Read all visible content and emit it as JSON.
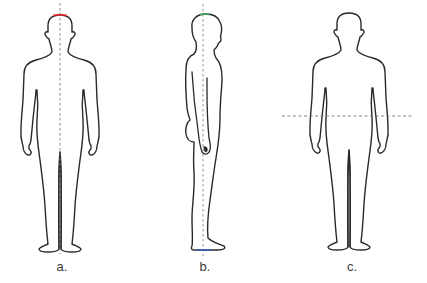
{
  "diagram": {
    "figures": [
      {
        "id": "a",
        "label": "a.",
        "view": "anterior",
        "reference_line": "vertical midline (sagittal plane)",
        "highlight": "red mark on top of head"
      },
      {
        "id": "b",
        "label": "b.",
        "view": "lateral",
        "reference_line": "vertical line (frontal/coronal plane)",
        "highlight": "green mark on head top, blue mark at feet"
      },
      {
        "id": "c",
        "label": "c.",
        "view": "anterior",
        "reference_line": "horizontal line at waist (transverse plane)"
      }
    ],
    "colors": {
      "outline": "#2a2a2a",
      "dashed_line": "#777777",
      "highlight_red": "#e8303a",
      "highlight_green": "#3aa85a",
      "highlight_blue": "#3a5ad8",
      "label": "#3a3a3a"
    }
  }
}
